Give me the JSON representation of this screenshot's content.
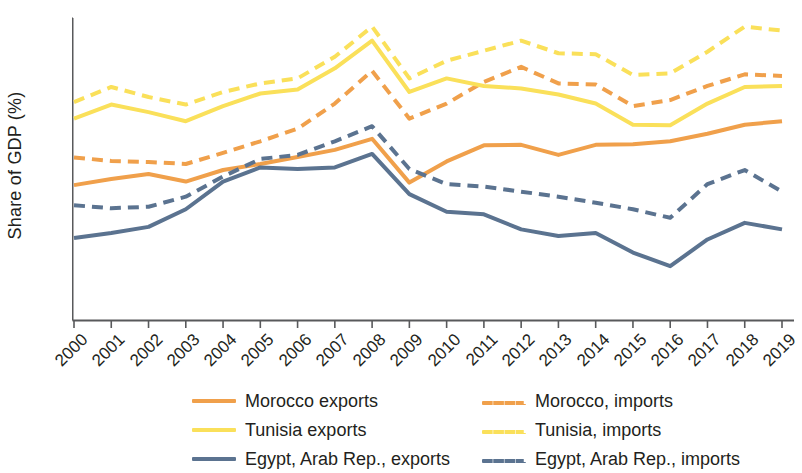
{
  "chart_data": {
    "type": "line",
    "title": "",
    "xlabel": "",
    "ylabel": "Share of GDP (%)",
    "ylim": [
      0,
      60
    ],
    "yticks": [
      0,
      10,
      20,
      30,
      40,
      50,
      60
    ],
    "xlim": [
      2000,
      2019
    ],
    "grid": false,
    "legend_position": "bottom",
    "categories": [
      "2000",
      "2001",
      "2002",
      "2003",
      "2004",
      "2005",
      "2006",
      "2007",
      "2008",
      "2009",
      "2010",
      "2011",
      "2012",
      "2013",
      "2014",
      "2015",
      "2016",
      "2017",
      "2018",
      "2019"
    ],
    "series": [
      {
        "name": "Morocco exports",
        "color": "#F0A04B",
        "style": "solid",
        "values": [
          26.8,
          28.0,
          29.0,
          27.5,
          29.8,
          31.0,
          32.4,
          33.8,
          36.0,
          27.3,
          31.5,
          34.7,
          34.8,
          32.8,
          34.8,
          34.9,
          35.5,
          37.0,
          38.8,
          39.5
        ]
      },
      {
        "name": "Morocco, imports",
        "color": "#F0A04B",
        "style": "dashed",
        "values": [
          32.3,
          31.6,
          31.4,
          31.0,
          33.2,
          35.5,
          38.0,
          43.0,
          49.5,
          40.0,
          43.0,
          47.3,
          50.3,
          47.0,
          46.8,
          42.5,
          43.7,
          46.5,
          48.8,
          48.5
        ]
      },
      {
        "name": "Tunisia exports",
        "color": "#FAE05A",
        "style": "solid",
        "values": [
          40.0,
          42.8,
          41.3,
          39.5,
          42.5,
          45.0,
          45.8,
          50.0,
          55.5,
          45.3,
          48.0,
          46.5,
          46.0,
          44.8,
          43.0,
          38.8,
          38.7,
          43.0,
          46.3,
          46.5
        ]
      },
      {
        "name": "Tunisia, imports",
        "color": "#FAE05A",
        "style": "dashed",
        "values": [
          43.3,
          46.3,
          44.3,
          42.8,
          45.3,
          47.0,
          48.0,
          52.3,
          58.3,
          48.0,
          51.5,
          53.5,
          55.5,
          53.0,
          52.8,
          48.7,
          49.0,
          53.3,
          58.3,
          57.5
        ]
      },
      {
        "name": "Egypt, Arab Rep., exports",
        "color": "#5B7390",
        "style": "solid",
        "values": [
          16.3,
          17.3,
          18.5,
          22.0,
          27.5,
          30.3,
          30.0,
          30.3,
          33.0,
          25.0,
          21.5,
          21.0,
          18.0,
          16.7,
          17.3,
          13.4,
          10.7,
          16.0,
          19.3,
          18.0
        ]
      },
      {
        "name": "Egypt, Arab Rep., imports",
        "color": "#5B7390",
        "style": "dashed",
        "values": [
          22.8,
          22.2,
          22.5,
          24.5,
          28.5,
          32.0,
          32.8,
          35.5,
          38.5,
          30.0,
          27.0,
          26.5,
          25.5,
          24.5,
          23.3,
          22.0,
          20.3,
          27.0,
          29.8,
          25.5
        ]
      }
    ]
  },
  "axis": {
    "ytick_labels": [
      "60",
      "50",
      "40",
      "30",
      "20",
      "10",
      "0"
    ],
    "xtick_labels": [
      "2000",
      "2001",
      "2002",
      "2003",
      "2004",
      "2005",
      "2006",
      "2007",
      "2008",
      "2009",
      "2010",
      "2011",
      "2012",
      "2013",
      "2014",
      "2015",
      "2016",
      "2017",
      "2018",
      "2019"
    ],
    "y_axis_title": "Share of GDP (%)",
    "axis_color": "#58595b"
  },
  "legend": {
    "entries": [
      {
        "label": "Morocco exports",
        "color": "#F0A04B",
        "style": "solid"
      },
      {
        "label": "Morocco, imports",
        "color": "#F0A04B",
        "style": "dashed"
      },
      {
        "label": "Tunisia exports",
        "color": "#FAE05A",
        "style": "solid"
      },
      {
        "label": "Tunisia, imports",
        "color": "#FAE05A",
        "style": "dashed"
      },
      {
        "label": "Egypt, Arab Rep., exports",
        "color": "#5B7390",
        "style": "solid"
      },
      {
        "label": "Egypt, Arab Rep., imports",
        "color": "#5B7390",
        "style": "dashed"
      }
    ]
  }
}
